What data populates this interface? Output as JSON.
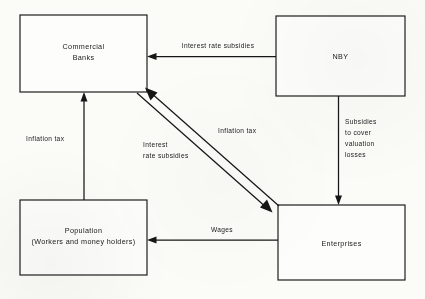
{
  "diagram": {
    "type": "flow-diagram",
    "background_color": "#fbfbf8",
    "stroke_color": "#161616",
    "nodes": [
      {
        "id": "commercial-banks",
        "lines": [
          "Commercial",
          "Banks"
        ],
        "line1": "Commercial",
        "line2": "Banks",
        "x": 20,
        "y": 15,
        "w": 127,
        "h": 77
      },
      {
        "id": "nby",
        "lines": [
          "NBY"
        ],
        "line1": "NBY",
        "line2": "",
        "x": 276,
        "y": 16,
        "w": 129,
        "h": 80
      },
      {
        "id": "population",
        "lines": [
          "Population",
          "(Workers and money holders)"
        ],
        "line1": "Population",
        "line2": "(Workers and money holders)",
        "x": 20,
        "y": 200,
        "w": 127,
        "h": 75
      },
      {
        "id": "enterprises",
        "lines": [
          "Enterprises"
        ],
        "line1": "Enterprises",
        "line2": "",
        "x": 278,
        "y": 205,
        "w": 127,
        "h": 75
      }
    ],
    "edges": [
      {
        "id": "nby-to-banks",
        "from": "nby",
        "to": "commercial-banks",
        "label": "Interest rate subsidies",
        "orientation": "horizontal-left"
      },
      {
        "id": "nby-to-enterprises",
        "from": "nby",
        "to": "enterprises",
        "label_line1": "Subsidies",
        "label_line2": "to cover",
        "label_line3": "valuation",
        "label_line4": "losses",
        "orientation": "vertical-down"
      },
      {
        "id": "population-to-banks",
        "from": "population",
        "to": "commercial-banks",
        "label": "Inflation tax",
        "orientation": "vertical-up"
      },
      {
        "id": "enterprises-to-population",
        "from": "enterprises",
        "to": "population",
        "label": "Wages",
        "orientation": "horizontal-left"
      },
      {
        "id": "enterprises-to-banks-diagonal",
        "from": "enterprises",
        "to": "commercial-banks",
        "label": "Inflation tax",
        "orientation": "diagonal-up-left"
      },
      {
        "id": "banks-to-enterprises-diagonal",
        "from": "commercial-banks",
        "to": "enterprises",
        "label_line1": "Interest",
        "label_line2": "rate subsidies",
        "orientation": "diagonal-down-right"
      }
    ]
  }
}
